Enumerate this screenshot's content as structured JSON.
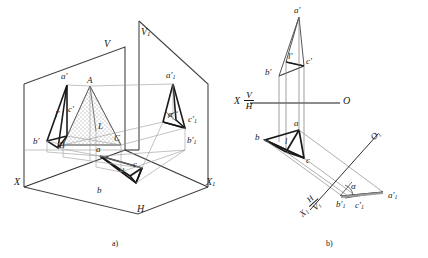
{
  "figure": {
    "caption_a": "a)",
    "caption_b": "b)"
  },
  "pictorial": {
    "plane_v": "V",
    "plane_v1": "V",
    "plane_v1_sub": "1",
    "plane_h": "H",
    "axis_x": "X",
    "axis_x1": "X",
    "axis_x1_sub": "1",
    "pt_A": "A",
    "pt_B": "B",
    "pt_C": "C",
    "pt_L": "L",
    "pt_a_prime": "a'",
    "pt_b_prime": "b'",
    "pt_c_prime": "c'",
    "pt_l_prime": "l'",
    "pt_a": "a",
    "pt_b": "b",
    "pt_c": "c",
    "pt_l": "l",
    "pt_a1_prime": "a'",
    "pt_a1_prime_sub": "1",
    "pt_b1_prime": "b'",
    "pt_b1_prime_sub": "1",
    "pt_c1_prime": "c'",
    "pt_c1_prime_sub": "1",
    "angle_alpha": "α"
  },
  "orthographic": {
    "axis_x": "X",
    "axis_o": "O",
    "axis_x1": "X",
    "axis_x1_sub": "1",
    "axis_o1": "O",
    "axis_o1_sub": "1",
    "plane_v": "V",
    "plane_h": "H",
    "plane_h2": "H",
    "plane_v1": "V",
    "plane_v1_sub": "1",
    "pt_a_prime": "a'",
    "pt_b_prime": "b'",
    "pt_c_prime": "c'",
    "pt_l_prime": "l'",
    "pt_a": "a",
    "pt_b": "b",
    "pt_c": "c",
    "pt_l": "l",
    "pt_a1_prime": "a'",
    "pt_a1_prime_sub": "1",
    "pt_b1_prime": "b'",
    "pt_b1_prime_sub": "1",
    "pt_c1_prime": "c'",
    "pt_c1_prime_sub": "1",
    "angle_alpha": "α"
  },
  "style": {
    "ink": "#1a1a1a",
    "thin": "#6e6e6e",
    "hatch": "#b9b9b9"
  }
}
